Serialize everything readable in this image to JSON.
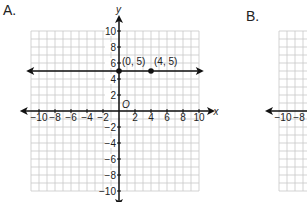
{
  "panels": [
    {
      "label": "A.",
      "axis_x_label": "x",
      "axis_y_label": "y",
      "origin_label": "O",
      "x_ticks": [
        "−10",
        "−8",
        "−6",
        "−4",
        "−2",
        "2",
        "4",
        "6",
        "8",
        "10"
      ],
      "y_ticks": [
        "10",
        "8",
        "6",
        "4",
        "2",
        "−2",
        "−4",
        "−6",
        "−8",
        "−10"
      ],
      "points": [
        {
          "label": "(0, 5)",
          "x": 0,
          "y": 5
        },
        {
          "label": "(4, 5)",
          "x": 4,
          "y": 5
        }
      ],
      "line": {
        "type": "horizontal",
        "y": 5
      }
    },
    {
      "label": "B.",
      "x_ticks": [
        "−10",
        "−8"
      ]
    }
  ],
  "colors": {
    "grid": "#c8c8c8",
    "axis": "#111111",
    "text": "#222222"
  }
}
